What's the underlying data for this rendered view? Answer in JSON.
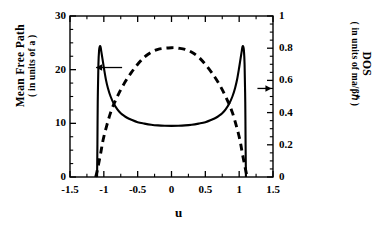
{
  "figure": {
    "background": "#ffffff",
    "line_color": "#000000"
  },
  "axes": {
    "x": {
      "label": "u",
      "ticks": [
        "-1.5",
        "-1",
        "-0.5",
        "0",
        "0.5",
        "1",
        "1.5"
      ],
      "tick_values": [
        -1.5,
        -1,
        -0.5,
        0,
        0.5,
        1,
        1.5
      ],
      "range": [
        -1.5,
        1.5
      ]
    },
    "y_left": {
      "title_line1": "Mean Free Path",
      "title_line2": "( in units of a )",
      "ticks": [
        "0",
        "10",
        "20",
        "30"
      ],
      "tick_values": [
        0,
        10,
        20,
        30
      ],
      "range": [
        0,
        30
      ]
    },
    "y_right": {
      "title_line1": "DOS",
      "title_line2": "( in units of ma/βℏ )",
      "ticks": [
        "0",
        "0.2",
        "0.4",
        "0.6",
        "0.8",
        "1"
      ],
      "tick_values": [
        0,
        0.2,
        0.4,
        0.6,
        0.8,
        1
      ],
      "range": [
        0,
        1
      ]
    }
  },
  "annotations": [
    {
      "name": "left-arrow",
      "points_to": "y_left",
      "direction": "left",
      "x": -0.73,
      "y_left": 20.4
    },
    {
      "name": "right-arrow",
      "points_to": "y_right",
      "direction": "right",
      "x": 1.27,
      "y_left": 16.5
    }
  ],
  "chart_data": {
    "type": "line",
    "title": "",
    "xlabel": "u",
    "ylabel": "Mean Free Path ( in units of a )",
    "ylabel2": "DOS ( in units of ma/βℏ )",
    "xlim": [
      -1.5,
      1.5
    ],
    "ylim": [
      0,
      30
    ],
    "ylim2": [
      0,
      1
    ],
    "grid": false,
    "legend": "arrows pointing to respective axes",
    "series": [
      {
        "name": "Mean Free Path",
        "axis": "left",
        "style": "solid",
        "color": "#000000",
        "x": [
          -1.1,
          -1.095,
          -1.09,
          -1.08,
          -1.07,
          -1.06,
          -1.05,
          -1.04,
          -1.02,
          -1.0,
          -0.97,
          -0.94,
          -0.9,
          -0.85,
          -0.8,
          -0.75,
          -0.7,
          -0.65,
          -0.6,
          -0.5,
          -0.4,
          -0.3,
          -0.2,
          -0.1,
          0.0,
          0.1,
          0.2,
          0.3,
          0.4,
          0.5,
          0.6,
          0.65,
          0.7,
          0.75,
          0.8,
          0.85,
          0.9,
          0.94,
          0.97,
          1.0,
          1.02,
          1.04,
          1.05,
          1.06,
          1.07,
          1.08,
          1.09,
          1.095,
          1.1
        ],
        "y": [
          0.0,
          6.0,
          14.0,
          21.0,
          23.6,
          24.3,
          24.3,
          23.6,
          22.0,
          20.4,
          18.2,
          16.6,
          15.0,
          13.6,
          12.6,
          11.9,
          11.4,
          11.0,
          10.7,
          10.2,
          9.95,
          9.75,
          9.62,
          9.55,
          9.52,
          9.55,
          9.62,
          9.75,
          9.95,
          10.2,
          10.7,
          11.0,
          11.4,
          11.9,
          12.6,
          13.6,
          15.0,
          16.6,
          18.2,
          20.4,
          22.0,
          23.6,
          24.3,
          24.3,
          23.6,
          21.0,
          14.0,
          6.0,
          0.0
        ]
      },
      {
        "name": "DOS",
        "axis": "right",
        "style": "dashed",
        "color": "#000000",
        "x": [
          -1.12,
          -1.1,
          -1.05,
          -1.0,
          -0.9,
          -0.8,
          -0.7,
          -0.6,
          -0.5,
          -0.4,
          -0.3,
          -0.2,
          -0.1,
          0.0,
          0.05,
          0.1,
          0.2,
          0.3,
          0.4,
          0.5,
          0.6,
          0.7,
          0.8,
          0.9,
          1.0,
          1.05,
          1.1,
          1.12
        ],
        "y": [
          0.0,
          0.035,
          0.14,
          0.25,
          0.4,
          0.5,
          0.58,
          0.645,
          0.7,
          0.745,
          0.775,
          0.793,
          0.8,
          0.803,
          0.803,
          0.8,
          0.793,
          0.775,
          0.745,
          0.7,
          0.645,
          0.58,
          0.5,
          0.4,
          0.25,
          0.14,
          0.035,
          0.0
        ]
      }
    ]
  }
}
